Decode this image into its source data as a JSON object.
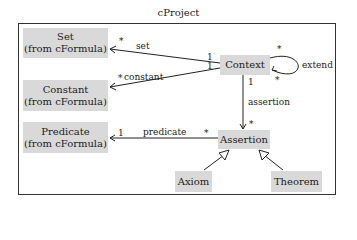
{
  "diagram": {
    "title": "cProject",
    "classes": {
      "set": {
        "line1": "Set",
        "line2": "(from cFormula)"
      },
      "constant": {
        "line1": "Constant",
        "line2": "(from cFormula)"
      },
      "predicate": {
        "line1": "Predicate",
        "line2": "(from cFormula)"
      },
      "context": {
        "name": "Context"
      },
      "assertion": {
        "name": "Assertion"
      },
      "axiom": {
        "name": "Axiom"
      },
      "theorem": {
        "name": "Theorem"
      }
    },
    "associations": {
      "set": {
        "label": "set",
        "source_mult": "1",
        "target_mult": "*"
      },
      "constant": {
        "label": "constant",
        "source_mult": "1",
        "target_mult": "*"
      },
      "extend": {
        "label": "extend",
        "source_mult": "*",
        "target_mult": "*"
      },
      "assertion": {
        "label": "assertion",
        "source_mult": "1",
        "target_mult": "*"
      },
      "predicate": {
        "label": "predicate",
        "source_mult": "*",
        "target_mult": "1"
      }
    },
    "generalizations": [
      {
        "from": "Axiom",
        "to": "Assertion"
      },
      {
        "from": "Theorem",
        "to": "Assertion"
      }
    ],
    "colors": {
      "box_fill": "#d9d9d9",
      "line": "#222222"
    }
  }
}
